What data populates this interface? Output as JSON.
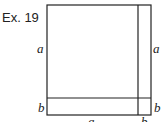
{
  "exercise_label": "Ex. 19",
  "diagram": {
    "left_top_label": "a",
    "left_bottom_label": "b",
    "right_top_label": "a",
    "right_bottom_label": "b",
    "bottom_left_label": "a",
    "bottom_right_label": "b"
  }
}
